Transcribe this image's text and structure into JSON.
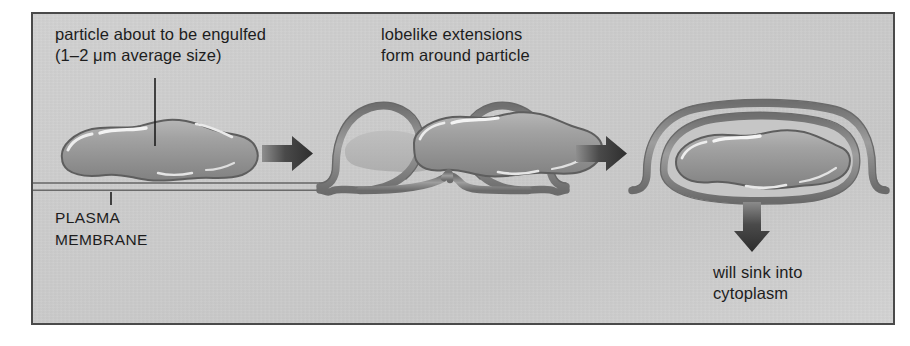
{
  "figure": {
    "background_color": "#cdcdcd",
    "border_color": "#4a4a4a",
    "ink_color": "#1d1d1d",
    "membrane_color": "#8d8d8d",
    "particle_color": "#9a9a9a",
    "arrow_color": "#3c3c3c"
  },
  "labels": {
    "particle": "particle about to be engulfed\n(1–2 μm average size)",
    "lobes": "lobelike extensions\nform around particle",
    "plasma_membrane": "PLASMA\nMEMBRANE",
    "sink": "will sink into\ncytoplasm"
  },
  "stages": [
    {
      "id": "stage-1",
      "name": "particle-resting-on-membrane",
      "description": "Irregular elongated particle sitting on the flat plasma membrane"
    },
    {
      "id": "stage-2",
      "name": "lobelike-extensions-forming",
      "description": "Two membrane lobes rise on each side and curl around the particle, nearly meeting in a notch"
    },
    {
      "id": "stage-3",
      "name": "particle-enclosed-in-vesicle",
      "description": "Particle fully enclosed by membrane forming a phagosome vesicle"
    }
  ],
  "arrows": [
    {
      "id": "arrow-1",
      "direction": "right",
      "from_stage": "stage-1",
      "to_stage": "stage-2"
    },
    {
      "id": "arrow-2",
      "direction": "right",
      "from_stage": "stage-2",
      "to_stage": "stage-3"
    },
    {
      "id": "arrow-3",
      "direction": "down",
      "from_stage": "stage-3",
      "to_stage": "cytoplasm"
    }
  ],
  "leader_lines": [
    {
      "id": "leader-particle",
      "from": "particle caption",
      "to": "particle body"
    },
    {
      "id": "leader-plasma-membrane",
      "from": "PLASMA MEMBRANE caption",
      "to": "membrane line"
    }
  ]
}
